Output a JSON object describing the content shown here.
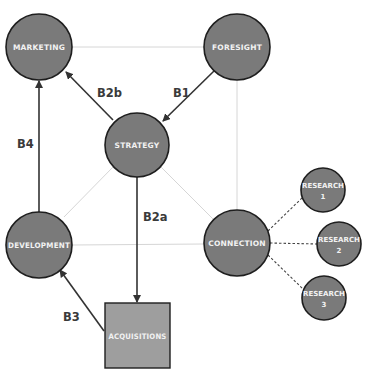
{
  "colors": {
    "node_fill": "#7a7a7a",
    "square_fill": "#9e9e9e",
    "node_stroke": "#1e1e1e",
    "arrow": "#333333",
    "grid_line": "#d6d6d6",
    "dashed": "#444444",
    "label_text": "#f2f2f2",
    "edge_label_text": "#3a3a3a"
  },
  "nodes": {
    "marketing": {
      "label": "MARKETING",
      "shape": "circle"
    },
    "foresight": {
      "label": "FORESIGHT",
      "shape": "circle"
    },
    "strategy": {
      "label": "STRATEGY",
      "shape": "circle"
    },
    "development": {
      "label": "DEVELOPMENT",
      "shape": "circle"
    },
    "connection": {
      "label": "CONNECTION",
      "shape": "circle"
    },
    "acquisitions": {
      "label": "ACQUISITIONS",
      "shape": "square"
    },
    "research1": {
      "label": "RESEARCH",
      "number": "1",
      "shape": "circle"
    },
    "research2": {
      "label": "RESEARCH",
      "number": "2",
      "shape": "circle"
    },
    "research3": {
      "label": "RESEARCH",
      "number": "3",
      "shape": "circle"
    }
  },
  "edges": {
    "b1": {
      "label": "B1",
      "from": "FORESIGHT",
      "to": "STRATEGY"
    },
    "b2a": {
      "label": "B2a",
      "from": "STRATEGY",
      "to": "ACQUISITIONS"
    },
    "b2b": {
      "label": "B2b",
      "from": "STRATEGY",
      "to": "MARKETING"
    },
    "b3": {
      "label": "B3",
      "from": "ACQUISITIONS",
      "to": "DEVELOPMENT"
    },
    "b4": {
      "label": "B4",
      "from": "DEVELOPMENT",
      "to": "MARKETING"
    }
  }
}
